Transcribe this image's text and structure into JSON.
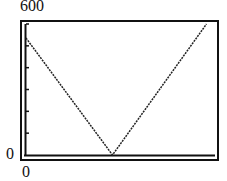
{
  "chart_data": {
    "type": "line",
    "title": "",
    "xlabel": "",
    "ylabel": "",
    "y_tick_labels": [
      "0",
      "600"
    ],
    "x_tick_labels": [
      "0"
    ],
    "ylim": [
      0,
      600
    ],
    "xlim_normalized": [
      0,
      1
    ],
    "grid": false,
    "legend": null,
    "series": [
      {
        "name": "V-shaped graph",
        "x_normalized": [
          0.0,
          0.46,
          0.96
        ],
        "y": [
          536,
          0,
          600
        ]
      }
    ],
    "y_ticks_count": 6
  },
  "labels": {
    "y_max": "600",
    "y_min": "0",
    "x_min": "0"
  }
}
